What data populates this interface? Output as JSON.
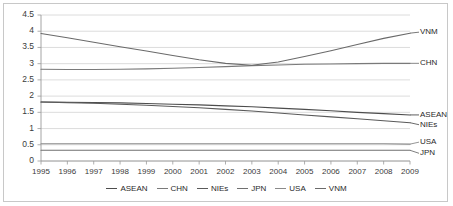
{
  "chart_data": {
    "type": "line",
    "title": "",
    "xlabel": "",
    "ylabel": "",
    "x": [
      1995,
      1996,
      1997,
      1998,
      1999,
      2000,
      2001,
      2002,
      2003,
      2004,
      2005,
      2006,
      2007,
      2008,
      2009
    ],
    "xlim": [
      1995,
      2009
    ],
    "ylim": [
      0,
      4.5
    ],
    "yticks": [
      "0",
      "0.5",
      "1",
      "1.5",
      "2",
      "2.5",
      "3",
      "3.5",
      "4",
      "4.5"
    ],
    "grid": true,
    "legend_position": "bottom",
    "series": [
      {
        "name": "ASEAN",
        "color": "#4d4d4d",
        "end_label": "ASEAN",
        "values": [
          1.82,
          1.81,
          1.8,
          1.79,
          1.77,
          1.75,
          1.73,
          1.7,
          1.67,
          1.63,
          1.59,
          1.55,
          1.5,
          1.46,
          1.42
        ]
      },
      {
        "name": "CHN",
        "color": "#7a7a7a",
        "end_label": "CHN",
        "values": [
          2.83,
          2.82,
          2.82,
          2.83,
          2.84,
          2.86,
          2.88,
          2.91,
          2.94,
          2.96,
          2.98,
          2.99,
          3.0,
          3.01,
          3.01
        ]
      },
      {
        "name": "NIEs",
        "color": "#5a5a5a",
        "end_label": "NIEs",
        "values": [
          1.82,
          1.8,
          1.78,
          1.75,
          1.72,
          1.68,
          1.64,
          1.59,
          1.54,
          1.48,
          1.42,
          1.36,
          1.3,
          1.24,
          1.18
        ]
      },
      {
        "name": "JPN",
        "color": "#707070",
        "end_label": "JPN",
        "values": [
          0.33,
          0.33,
          0.33,
          0.33,
          0.33,
          0.33,
          0.33,
          0.33,
          0.33,
          0.33,
          0.33,
          0.33,
          0.33,
          0.33,
          0.33
        ]
      },
      {
        "name": "USA",
        "color": "#8a8a8a",
        "end_label": "USA",
        "values": [
          0.53,
          0.53,
          0.53,
          0.53,
          0.53,
          0.53,
          0.53,
          0.53,
          0.53,
          0.53,
          0.53,
          0.53,
          0.53,
          0.53,
          0.52
        ]
      },
      {
        "name": "VNM",
        "color": "#6a6a6a",
        "end_label": "VNM",
        "values": [
          3.93,
          3.8,
          3.66,
          3.52,
          3.39,
          3.25,
          3.12,
          3.01,
          2.95,
          3.05,
          3.22,
          3.4,
          3.59,
          3.78,
          3.94
        ]
      }
    ]
  },
  "axis": {
    "y_ticks": [
      "4.5",
      "4",
      "3.5",
      "3",
      "2.5",
      "2",
      "1.5",
      "1",
      "0.5",
      "0"
    ],
    "x_ticks": [
      "1995",
      "1996",
      "1997",
      "1998",
      "1999",
      "2000",
      "2001",
      "2002",
      "2003",
      "2004",
      "2005",
      "2006",
      "2007",
      "2008",
      "2009"
    ]
  },
  "end_labels": [
    {
      "text": "VNM"
    },
    {
      "text": "CHN"
    },
    {
      "text": "ASEAN"
    },
    {
      "text": "NIEs"
    },
    {
      "text": "USA"
    },
    {
      "text": "JPN"
    }
  ],
  "legend": {
    "items": [
      {
        "label": "ASEAN"
      },
      {
        "label": "CHN"
      },
      {
        "label": "NIEs"
      },
      {
        "label": "JPN"
      },
      {
        "label": "USA"
      },
      {
        "label": "VNM"
      }
    ]
  }
}
